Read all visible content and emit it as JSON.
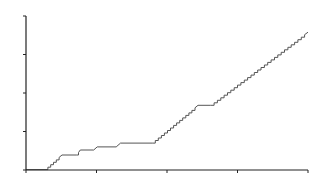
{
  "chart_data": {
    "type": "line",
    "title": "",
    "xlabel": "",
    "ylabel": "",
    "xlim": [
      0,
      4
    ],
    "ylim": [
      0,
      4
    ],
    "x_ticks": [
      0,
      1,
      2,
      3,
      4
    ],
    "y_ticks": [
      0,
      1,
      2,
      3,
      4
    ],
    "tick_labels_visible": false,
    "grid": false,
    "legend": null,
    "line_color": "#555555",
    "axis_color": "#222222",
    "series": [
      {
        "name": "series",
        "x": [
          0,
          0.27,
          0.51,
          0.72,
          0.77,
          0.96,
          1.01,
          1.28,
          1.34,
          1.79,
          2.44,
          2.62,
          4.0
        ],
        "y": [
          0.01,
          0.01,
          0.39,
          0.39,
          0.52,
          0.52,
          0.6,
          0.6,
          0.7,
          0.7,
          1.68,
          1.68,
          3.58
        ]
      }
    ]
  }
}
